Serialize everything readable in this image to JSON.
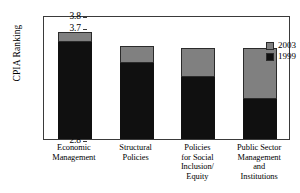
{
  "chart_data": {
    "type": "bar",
    "stacked": true,
    "title": "",
    "xlabel": "",
    "ylabel": "CPIA Ranking",
    "ylim": [
      2.8,
      3.8
    ],
    "ytick_step": 0.1,
    "yticks": [
      "3.8",
      "3.7",
      "3.6",
      "3.5",
      "3.4",
      "3.3",
      "3.2",
      "3.1",
      "3.0",
      "2.9",
      "2.8"
    ],
    "grid": false,
    "legend_position": "top-right-inside",
    "categories": [
      "Economic Management",
      "Structural Policies",
      "Policies for Social Inclusion/ Equity",
      "Public Sector Management and Institutions"
    ],
    "category_lines": [
      [
        "Economic",
        "Management"
      ],
      [
        "Structural",
        "Policies"
      ],
      [
        "Policies",
        "for Social",
        "Inclusion/",
        "Equity"
      ],
      [
        "Public Sector",
        "Management",
        "and",
        "Institutions"
      ]
    ],
    "series": [
      {
        "name": "1999",
        "color": "#101010",
        "values": [
          3.58,
          3.41,
          3.3,
          3.12
        ]
      },
      {
        "name": "2003",
        "color": "#808080",
        "values": [
          3.66,
          3.55,
          3.53,
          3.53
        ]
      }
    ]
  },
  "legend": {
    "items": [
      {
        "label": "2003",
        "color": "#808080"
      },
      {
        "label": "1999",
        "color": "#101010"
      }
    ]
  },
  "colors": {
    "series_2003": "#808080",
    "series_1999": "#101010",
    "axis": "#3a3a3a",
    "background": "#ffffff"
  }
}
